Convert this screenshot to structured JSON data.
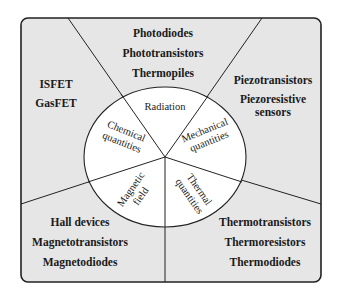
{
  "diagram": {
    "center": {
      "radiation": "Radiation",
      "chemical": [
        "Chemical",
        "quantities"
      ],
      "mechanical": [
        "Mechanical",
        "quantities"
      ],
      "magnetic": [
        "Magnetic",
        "field"
      ],
      "thermal": [
        "Thermal",
        "quantities"
      ]
    },
    "outer": {
      "radiation": [
        "Photodiodes",
        "Phototransistors",
        "Thermopiles"
      ],
      "chemical": [
        "ISFET",
        "GasFET"
      ],
      "mechanical": [
        "Piezotransistors",
        "Piezoresistive",
        "sensors"
      ],
      "magnetic": [
        "Hall devices",
        "Magnetotransistors",
        "Magnetodiodes"
      ],
      "thermal": [
        "Thermotransistors",
        "Thermoresistors",
        "Thermodiodes"
      ]
    },
    "colors": {
      "outer_fill": "#e6e6e6",
      "circle_fill": "#ffffff",
      "stroke": "#222222"
    }
  }
}
